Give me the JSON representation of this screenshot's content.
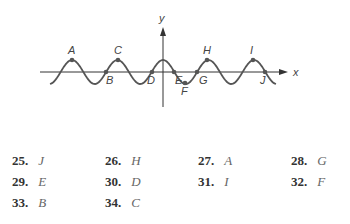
{
  "chart_data": {
    "type": "line",
    "title": "",
    "xlabel": "x",
    "ylabel": "y",
    "points": [
      {
        "label": "A",
        "position": "maximum",
        "x_px": 72,
        "y_px": 60
      },
      {
        "label": "B",
        "position": "x-intercept",
        "x_px": 106,
        "y_px": 72
      },
      {
        "label": "C",
        "position": "maximum",
        "x_px": 118,
        "y_px": 60
      },
      {
        "label": "D",
        "position": "x-intercept",
        "x_px": 152,
        "y_px": 72
      },
      {
        "label": "E",
        "position": "x-intercept",
        "x_px": 174,
        "y_px": 72
      },
      {
        "label": "F",
        "position": "minimum",
        "x_px": 185,
        "y_px": 83
      },
      {
        "label": "G",
        "position": "x-intercept",
        "x_px": 197,
        "y_px": 72
      },
      {
        "label": "H",
        "position": "maximum",
        "x_px": 207,
        "y_px": 60
      },
      {
        "label": "I",
        "position": "maximum",
        "x_px": 253,
        "y_px": 60
      },
      {
        "label": "J",
        "position": "x-intercept",
        "x_px": 265,
        "y_px": 72
      }
    ]
  },
  "graph": {
    "x_axis_label": "x",
    "y_axis_label": "y",
    "curve_color": "#555555",
    "axis_color": "#333333",
    "point_labels": [
      "A",
      "B",
      "C",
      "D",
      "E",
      "F",
      "G",
      "H",
      "I",
      "J"
    ]
  },
  "answers": [
    {
      "num": "25.",
      "letter": "J"
    },
    {
      "num": "26.",
      "letter": "H"
    },
    {
      "num": "27.",
      "letter": "A"
    },
    {
      "num": "28.",
      "letter": "G"
    },
    {
      "num": "29.",
      "letter": "E"
    },
    {
      "num": "30.",
      "letter": "D"
    },
    {
      "num": "31.",
      "letter": "I"
    },
    {
      "num": "32.",
      "letter": "F"
    },
    {
      "num": "33.",
      "letter": "B"
    },
    {
      "num": "34.",
      "letter": "C"
    }
  ]
}
